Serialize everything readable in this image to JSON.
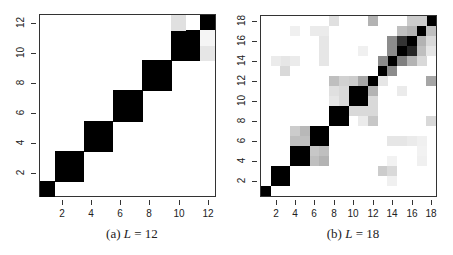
{
  "chart_data": [
    {
      "type": "heatmap",
      "caption_prefix": "(a) ",
      "caption_var": "L",
      "caption_rest": " = 12",
      "L": 12,
      "xticks": [
        2,
        4,
        6,
        8,
        10,
        12
      ],
      "yticks": [
        2,
        4,
        6,
        8,
        10,
        12
      ],
      "xlim": [
        0.5,
        12.5
      ],
      "ylim": [
        0.5,
        12.5
      ],
      "plot_box": {
        "left": 39,
        "top": 14,
        "right": 216,
        "bottom": 197
      },
      "colormap": "white-to-black (higher = darker)",
      "cells": [
        [
          1,
          1,
          1.0
        ],
        [
          2,
          2,
          1.0
        ],
        [
          2,
          3,
          1.0
        ],
        [
          3,
          2,
          1.0
        ],
        [
          3,
          3,
          1.0
        ],
        [
          4,
          4,
          1.0
        ],
        [
          4,
          5,
          1.0
        ],
        [
          5,
          4,
          1.0
        ],
        [
          5,
          5,
          1.0
        ],
        [
          6,
          6,
          1.0
        ],
        [
          6,
          7,
          1.0
        ],
        [
          7,
          6,
          1.0
        ],
        [
          7,
          7,
          1.0
        ],
        [
          8,
          8,
          1.0
        ],
        [
          8,
          9,
          1.0
        ],
        [
          9,
          8,
          1.0
        ],
        [
          9,
          9,
          1.0
        ],
        [
          10,
          10,
          1.0
        ],
        [
          10,
          11,
          1.0
        ],
        [
          11,
          10,
          1.0
        ],
        [
          11,
          11,
          1.0
        ],
        [
          12,
          12,
          1.0
        ],
        [
          10,
          12,
          0.12
        ],
        [
          12,
          10,
          0.1
        ],
        [
          12,
          11,
          0.04
        ]
      ]
    },
    {
      "type": "heatmap",
      "caption_prefix": "(b) ",
      "caption_var": "L",
      "caption_rest": " = 18",
      "L": 18,
      "xticks": [
        2,
        4,
        6,
        8,
        10,
        12,
        14,
        16,
        18
      ],
      "yticks": [
        2,
        4,
        6,
        8,
        10,
        12,
        14,
        16,
        18
      ],
      "xlim": [
        0.5,
        18.5
      ],
      "ylim": [
        0.5,
        18.5
      ],
      "plot_box": {
        "left": 260,
        "top": 15,
        "right": 437,
        "bottom": 197
      },
      "colormap": "white-to-black (higher = darker)",
      "cells": [
        [
          1,
          1,
          1.0
        ],
        [
          2,
          2,
          1.0
        ],
        [
          2,
          3,
          1.0
        ],
        [
          3,
          2,
          1.0
        ],
        [
          3,
          3,
          1.0
        ],
        [
          4,
          4,
          1.0
        ],
        [
          4,
          5,
          1.0
        ],
        [
          5,
          4,
          1.0
        ],
        [
          5,
          5,
          1.0
        ],
        [
          6,
          6,
          1.0
        ],
        [
          6,
          7,
          1.0
        ],
        [
          7,
          6,
          1.0
        ],
        [
          7,
          7,
          1.0
        ],
        [
          8,
          8,
          1.0
        ],
        [
          8,
          9,
          1.0
        ],
        [
          9,
          8,
          1.0
        ],
        [
          9,
          9,
          1.0
        ],
        [
          10,
          10,
          1.0
        ],
        [
          10,
          11,
          1.0
        ],
        [
          11,
          10,
          1.0
        ],
        [
          11,
          11,
          1.0
        ],
        [
          12,
          12,
          1.0
        ],
        [
          13,
          13,
          1.0
        ],
        [
          14,
          14,
          1.0
        ],
        [
          15,
          15,
          1.0
        ],
        [
          16,
          16,
          1.0
        ],
        [
          17,
          17,
          1.0
        ],
        [
          18,
          18,
          1.0
        ],
        [
          4,
          6,
          0.25
        ],
        [
          5,
          6,
          0.25
        ],
        [
          4,
          7,
          0.2
        ],
        [
          5,
          7,
          0.28
        ],
        [
          6,
          4,
          0.25
        ],
        [
          7,
          4,
          0.3
        ],
        [
          6,
          5,
          0.22
        ],
        [
          7,
          5,
          0.25
        ],
        [
          8,
          12,
          0.25
        ],
        [
          9,
          12,
          0.18
        ],
        [
          10,
          12,
          0.2
        ],
        [
          11,
          12,
          0.35
        ],
        [
          12,
          8,
          0.25
        ],
        [
          12,
          11,
          0.3
        ],
        [
          12,
          10,
          0.15
        ],
        [
          12,
          9,
          0.15
        ],
        [
          8,
          11,
          0.12
        ],
        [
          9,
          11,
          0.15
        ],
        [
          9,
          10,
          0.15
        ],
        [
          8,
          10,
          0.1
        ],
        [
          10,
          9,
          0.15
        ],
        [
          11,
          9,
          0.15
        ],
        [
          12,
          8,
          0.22
        ],
        [
          11,
          8,
          0.08
        ],
        [
          13,
          14,
          0.45
        ],
        [
          14,
          13,
          0.45
        ],
        [
          13,
          12,
          0.1
        ],
        [
          14,
          15,
          0.45
        ],
        [
          14,
          16,
          0.45
        ],
        [
          15,
          14,
          0.5
        ],
        [
          16,
          14,
          0.3
        ],
        [
          15,
          16,
          0.8
        ],
        [
          16,
          15,
          0.85
        ],
        [
          15,
          17,
          0.25
        ],
        [
          16,
          17,
          0.3
        ],
        [
          17,
          15,
          0.25
        ],
        [
          17,
          16,
          0.3
        ],
        [
          17,
          18,
          0.2
        ],
        [
          16,
          18,
          0.2
        ],
        [
          18,
          17,
          0.25
        ],
        [
          18,
          16,
          0.15
        ],
        [
          18,
          15,
          0.1
        ],
        [
          17,
          14,
          0.15
        ],
        [
          8,
          18,
          0.12
        ],
        [
          12,
          18,
          0.3
        ],
        [
          18,
          12,
          0.35
        ],
        [
          18,
          8,
          0.15
        ],
        [
          3,
          13,
          0.15
        ],
        [
          3,
          14,
          0.1
        ],
        [
          2,
          14,
          0.08
        ],
        [
          4,
          14,
          0.08
        ],
        [
          7,
          14,
          0.1
        ],
        [
          7,
          15,
          0.1
        ],
        [
          7,
          16,
          0.1
        ],
        [
          7,
          17,
          0.08
        ],
        [
          6,
          17,
          0.08
        ],
        [
          4,
          17,
          0.06
        ],
        [
          11,
          15,
          0.06
        ],
        [
          13,
          3,
          0.2
        ],
        [
          14,
          3,
          0.15
        ],
        [
          14,
          2,
          0.06
        ],
        [
          14,
          4,
          0.05
        ],
        [
          14,
          6,
          0.1
        ],
        [
          15,
          6,
          0.1
        ],
        [
          16,
          6,
          0.08
        ],
        [
          17,
          6,
          0.06
        ],
        [
          17,
          5,
          0.05
        ],
        [
          17,
          4,
          0.06
        ],
        [
          15,
          11,
          0.08
        ]
      ]
    }
  ],
  "panels": [
    {
      "caption": "(a) L = 12"
    },
    {
      "caption": "(b) L = 18"
    }
  ]
}
